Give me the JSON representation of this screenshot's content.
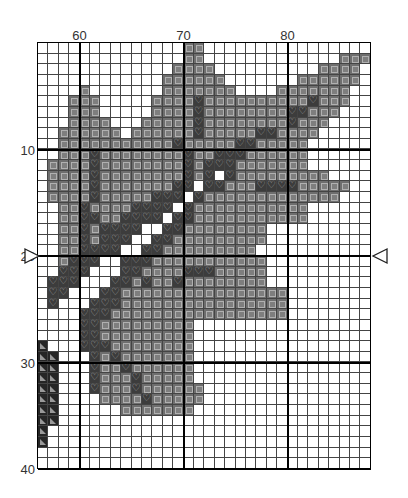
{
  "chart": {
    "first_col": 56,
    "first_row": 1,
    "cols": 32,
    "rows": 40,
    "col_labels": [
      {
        "value": "60",
        "col": 60
      },
      {
        "value": "70",
        "col": 70
      },
      {
        "value": "80",
        "col": 80
      }
    ],
    "row_labels": [
      {
        "value": "10",
        "row": 10
      },
      {
        "value": "20",
        "row": 20
      },
      {
        "value": "30",
        "row": 30
      },
      {
        "value": "40",
        "row": 40
      }
    ],
    "center_markers": {
      "row": 20,
      "left": "right-pointing-triangle",
      "right": "left-pointing-triangle"
    },
    "legend_symbols": {
      "s": {
        "symbol": "square",
        "color": "#6e6e6e"
      },
      "h": {
        "symbol": "heart",
        "color": "#3c3c3c"
      },
      "t": {
        "symbol": "triangle",
        "color": "#262626"
      }
    },
    "grid": [
      "..............ss................",
      "..............ss.............sss",
      ".............ssss..........ssss.",
      "............ssssss.......ssssss.",
      "....s.......sssssss....sssssss..",
      "...sss.....sssshsssssssssshsss..",
      "...sss.....sssshsssssssshhsss...",
      "...ssss...ssssshsssssssshsss....",
      "..ssssss.sssssshssssshhssss.....",
      "..ssssssssssshssssshhsssss......",
      "..ssshsssssssshsshhhssssss......",
      ".sssshsssssssshshhhsssssss......",
      ".sssshsssssssshsh.hsssssssss....",
      ".sssshssssssshh.hhssshhhhsssss..",
      ".sssshssssshhh.hsssssssssssss...",
      "..sshsssshhhh.hsssssssssss......",
      "..sshhsshhhh.hhsssssssssss......",
      "..sshshhhh..hhssssssss..........",
      "..sshshhh..hhsssssssss..........",
      "..sshhhh..hhsssssssss...........",
      "..shhh..hhhsssssssssss..........",
      "..hhh...hhsssshhhsssss..........",
      ".hhh...hhshsshssssssss..........",
      ".hh...hhssssssssssssssss........",
      ".h...hhhssssssssssssssss........",
      "....hhhsssssssssssssssss........",
      "....hhsssssssss.................",
      "....hhsssssssss.................",
      "t...hhhssssssss.................",
      "tt...hshsssssss.................",
      "tt...hsshssssss.................",
      "tt...hssshsssss.................",
      "tt...hssshssssss................",
      "tt....sssshsssss................",
      "tt......sssssss.................",
      "tt..............................",
      "t...............................",
      "t...............................",
      "................................",
      "................................"
    ]
  }
}
